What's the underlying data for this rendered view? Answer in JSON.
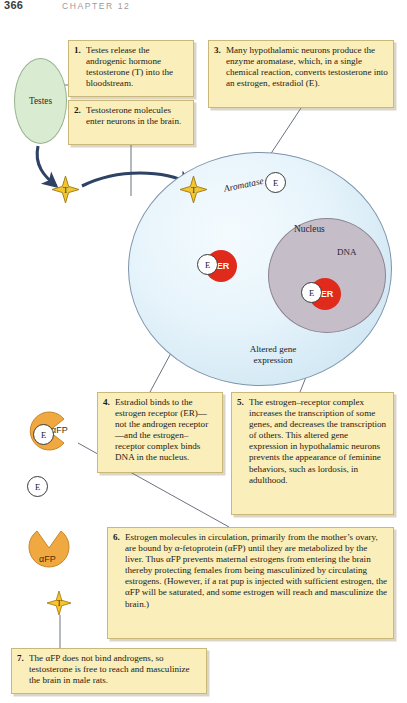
{
  "page": {
    "number": "366",
    "chapter_label": "CHAPTER 12"
  },
  "figure": {
    "labels": {
      "testes": "Testes",
      "aromatase": "Aromatase",
      "nucleus": "Nucleus",
      "dna": "DNA",
      "altered_gene_expression": "Altered gene expression"
    },
    "molecules": {
      "testosterone": "T",
      "estradiol": "E",
      "estrogen_receptor": "ER",
      "alpha_fetoprotein": "αFP"
    }
  },
  "steps": [
    {
      "number": "1.",
      "text": "Testes release the androgenic hormone testosterone (T) into the bloodstream."
    },
    {
      "number": "2.",
      "text": "Testosterone molecules enter neurons in the brain."
    },
    {
      "number": "3.",
      "text": "Many hypothalamic neurons produce the enzyme aromatase, which, in a single chemical reaction, converts testosterone into an estrogen, estradiol (E)."
    },
    {
      "number": "4.",
      "text": "Estradiol binds to the estrogen receptor (ER)—not the androgen receptor—and the estrogen–receptor complex binds DNA in the nucleus."
    },
    {
      "number": "5.",
      "text": "The estrogen–receptor complex increases the transcription of some genes, and decreases the transcription of others. This altered gene expression in hypothalamic neurons prevents the appearance of feminine behaviors, such as lordosis, in adulthood."
    },
    {
      "number": "6.",
      "text": "Estrogen molecules in circulation, primarily from the mother’s ovary, are bound by α-fetoprotein (αFP) until they are metabolized by the liver. Thus αFP prevents maternal estrogens from entering the brain thereby protecting females from being masculinized by circulating estrogens. (However, if a rat pup is injected with sufficient estrogen, the αFP will be saturated, and some estrogen will reach and masculinize the brain.)"
    },
    {
      "number": "7.",
      "text": "The αFP does not bind androgens, so testosterone is free to reach and masculinize the brain in male rats."
    }
  ],
  "colors": {
    "callout_fill": "#faeeba",
    "callout_border": "#c9b87a",
    "testes_fill": "#d9ecd2",
    "cell_fill": "#e7f4fb",
    "nucleus_fill": "#c5bdc8",
    "testosterone_fill": "#f5c531",
    "receptor_fill": "#e02a1c",
    "afp_fill": "#f0a940",
    "arrow": "#2e4265"
  }
}
